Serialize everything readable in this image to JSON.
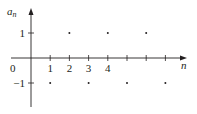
{
  "chart_data": {
    "type": "scatter",
    "title": "",
    "xlabel": "n",
    "ylabel": "a_n",
    "ylabel_main": "a",
    "ylabel_sub": "n",
    "origin_label": "0",
    "x_tick_labels": [
      "1",
      "2",
      "3",
      "4"
    ],
    "x_ticks": [
      1,
      2,
      3,
      4,
      5,
      6,
      7
    ],
    "y_tick_labels": [
      "1",
      "−1"
    ],
    "y_ticks": [
      1,
      -1
    ],
    "series": [
      {
        "name": "a_n = (-1)^n",
        "x": [
          1,
          2,
          3,
          4,
          5,
          6,
          7
        ],
        "y": [
          -1,
          1,
          -1,
          1,
          -1,
          1,
          -1
        ]
      }
    ],
    "xlim": [
      0,
      8
    ],
    "ylim": [
      -1.5,
      1.5
    ],
    "grid": false,
    "legend": "none"
  }
}
